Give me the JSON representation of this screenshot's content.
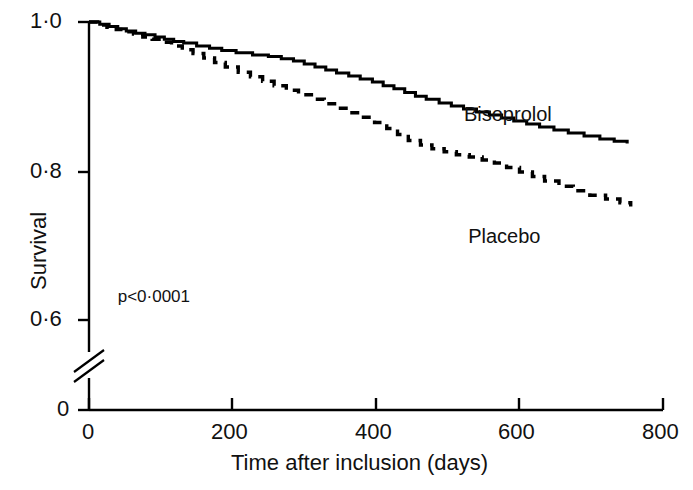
{
  "chart_data": {
    "type": "line",
    "subtype": "kaplan-meier-step",
    "title": "",
    "xlabel": "Time after inclusion (days)",
    "ylabel": "Survival",
    "xlim": [
      0,
      800
    ],
    "ylim": [
      0.56,
      1.0
    ],
    "grid": false,
    "legend_position": "inline-right-of-curves",
    "axis_break": {
      "present": true,
      "axis": "y",
      "between": [
        0.0,
        0.56
      ],
      "style": "double-diagonal-slash"
    },
    "xticks": [
      0,
      200,
      400,
      600,
      800
    ],
    "xtick_labels": [
      "0",
      "200",
      "400",
      "600",
      "800"
    ],
    "yticks": [
      0.6,
      0.8,
      1.0
    ],
    "ytick_labels": [
      "0·6",
      "0·8",
      "1·0"
    ],
    "y_origin_tick_label": "0",
    "annotations": [
      {
        "name": "p-value",
        "text": "p<0·0001",
        "x_days": 40,
        "y_survival": 0.633
      }
    ],
    "series": [
      {
        "name": "Bisoprolol",
        "linestyle": "solid",
        "color": "#000000",
        "label_x_days": 655,
        "label_y_survival": 0.876,
        "x": [
          0,
          15,
          28,
          40,
          52,
          65,
          78,
          92,
          105,
          118,
          132,
          150,
          168,
          185,
          205,
          228,
          250,
          268,
          285,
          300,
          315,
          330,
          345,
          362,
          378,
          395,
          410,
          425,
          440,
          455,
          470,
          488,
          505,
          522,
          540,
          558,
          575,
          592,
          610,
          628,
          648,
          668,
          690,
          712,
          732,
          750
        ],
        "y": [
          1.0,
          0.997,
          0.994,
          0.991,
          0.988,
          0.985,
          0.983,
          0.98,
          0.977,
          0.974,
          0.972,
          0.968,
          0.965,
          0.962,
          0.959,
          0.956,
          0.954,
          0.951,
          0.948,
          0.944,
          0.94,
          0.936,
          0.932,
          0.928,
          0.924,
          0.92,
          0.915,
          0.911,
          0.906,
          0.901,
          0.897,
          0.892,
          0.888,
          0.884,
          0.88,
          0.876,
          0.872,
          0.868,
          0.864,
          0.86,
          0.856,
          0.852,
          0.848,
          0.844,
          0.841,
          0.838
        ]
      },
      {
        "name": "Placebo",
        "linestyle": "dashed",
        "color": "#000000",
        "label_x_days": 640,
        "label_y_survival": 0.714,
        "x": [
          0,
          12,
          25,
          38,
          50,
          62,
          75,
          88,
          100,
          115,
          130,
          145,
          160,
          175,
          190,
          208,
          225,
          242,
          258,
          275,
          292,
          310,
          328,
          345,
          362,
          380,
          398,
          415,
          430,
          445,
          462,
          478,
          495,
          512,
          530,
          548,
          565,
          582,
          600,
          618,
          635,
          655,
          675,
          698,
          720,
          740,
          755
        ],
        "y": [
          1.0,
          0.996,
          0.993,
          0.99,
          0.987,
          0.984,
          0.98,
          0.977,
          0.973,
          0.968,
          0.963,
          0.958,
          0.952,
          0.946,
          0.94,
          0.933,
          0.927,
          0.921,
          0.915,
          0.909,
          0.903,
          0.897,
          0.891,
          0.885,
          0.879,
          0.873,
          0.866,
          0.858,
          0.85,
          0.842,
          0.836,
          0.831,
          0.827,
          0.823,
          0.82,
          0.816,
          0.812,
          0.806,
          0.8,
          0.794,
          0.788,
          0.781,
          0.775,
          0.769,
          0.764,
          0.759,
          0.754
        ]
      }
    ]
  },
  "axes": {
    "y_title": "Survival",
    "x_title": "Time after inclusion (days)"
  }
}
